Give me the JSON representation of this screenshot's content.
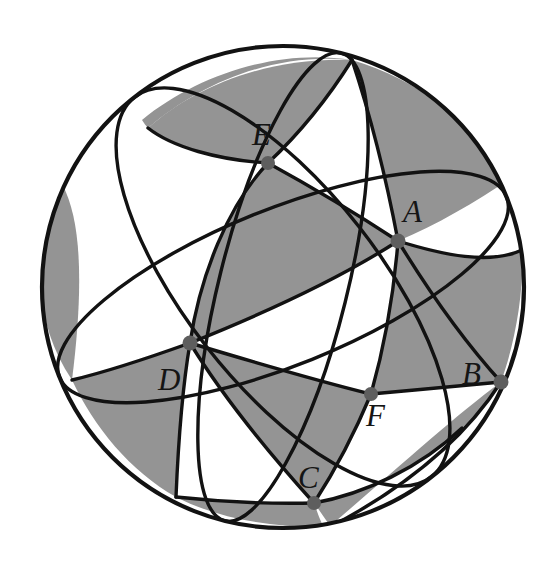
{
  "figure": {
    "name": "sphere-with-three-great-circles",
    "canvas": {
      "width": 559,
      "height": 569
    },
    "sphere": {
      "center": {
        "x": 283,
        "y": 287
      },
      "radius": 241,
      "outline_color": "#121212",
      "outline_width": 4,
      "fill_color": "#ffffff"
    },
    "colors": {
      "shaded_region": "#949494",
      "unshaded_region": "#ffffff",
      "arc_stroke": "#121212",
      "vertex_dot": "#5e5e5e",
      "label_text": "#151515"
    },
    "vertex_dot_radius": 7,
    "labels": [
      {
        "text": "E",
        "x": 252,
        "y": 119
      },
      {
        "text": "A",
        "x": 403,
        "y": 196
      },
      {
        "text": "B",
        "x": 462,
        "y": 358
      },
      {
        "text": "F",
        "x": 366,
        "y": 400
      },
      {
        "text": "C",
        "x": 298,
        "y": 462
      },
      {
        "text": "D",
        "x": 158,
        "y": 364
      }
    ],
    "vertices": [
      {
        "name": "E",
        "x": 268,
        "y": 163
      },
      {
        "name": "A",
        "x": 398,
        "y": 241
      },
      {
        "name": "B",
        "x": 501,
        "y": 382
      },
      {
        "name": "F",
        "x": 371,
        "y": 394
      },
      {
        "name": "C",
        "x": 314,
        "y": 503
      },
      {
        "name": "D",
        "x": 190,
        "y": 343
      }
    ],
    "great_circles": [
      {
        "name": "great-circle-1",
        "rx": 241,
        "ry": 78,
        "rotation": -22
      },
      {
        "name": "great-circle-2",
        "rx": 241,
        "ry": 96,
        "rotation": 52
      },
      {
        "name": "great-circle-3",
        "rx": 241,
        "ry": 64,
        "rotation": 104
      }
    ]
  }
}
